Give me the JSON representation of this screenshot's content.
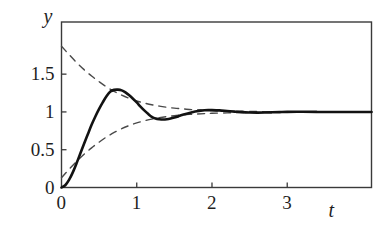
{
  "chart_data": {
    "type": "line",
    "title": "",
    "xlabel": "t",
    "ylabel": "y",
    "xlim": [
      0,
      4.12
    ],
    "ylim": [
      0,
      2.19
    ],
    "grid": false,
    "legend": null,
    "xticks": [
      0,
      1,
      2,
      3
    ],
    "xtick_labels": [
      "0",
      "1",
      "2",
      "3"
    ],
    "yticks": [
      0,
      0.5,
      1,
      1.5
    ],
    "ytick_labels": [
      "0",
      "0.5",
      "1",
      "1.5"
    ],
    "series": [
      {
        "name": "step response",
        "style": "solid",
        "color": "#121212",
        "linewidth": 2.6,
        "points": [
          [
            0.0,
            0.0
          ],
          [
            0.05,
            0.03
          ],
          [
            0.1,
            0.1
          ],
          [
            0.15,
            0.2
          ],
          [
            0.2,
            0.32
          ],
          [
            0.25,
            0.45
          ],
          [
            0.3,
            0.58
          ],
          [
            0.35,
            0.705
          ],
          [
            0.4,
            0.83
          ],
          [
            0.45,
            0.94
          ],
          [
            0.5,
            1.04
          ],
          [
            0.55,
            1.13
          ],
          [
            0.6,
            1.21
          ],
          [
            0.65,
            1.27
          ],
          [
            0.7,
            1.292
          ],
          [
            0.75,
            1.295
          ],
          [
            0.8,
            1.285
          ],
          [
            0.85,
            1.258
          ],
          [
            0.9,
            1.22
          ],
          [
            0.95,
            1.175
          ],
          [
            1.0,
            1.125
          ],
          [
            1.05,
            1.07
          ],
          [
            1.1,
            1.02
          ],
          [
            1.15,
            0.975
          ],
          [
            1.2,
            0.935
          ],
          [
            1.25,
            0.912
          ],
          [
            1.3,
            0.903
          ],
          [
            1.35,
            0.9
          ],
          [
            1.4,
            0.903
          ],
          [
            1.45,
            0.912
          ],
          [
            1.5,
            0.925
          ],
          [
            1.55,
            0.941
          ],
          [
            1.6,
            0.958
          ],
          [
            1.65,
            0.973
          ],
          [
            1.7,
            0.987
          ],
          [
            1.75,
            0.999
          ],
          [
            1.8,
            1.009
          ],
          [
            1.85,
            1.017
          ],
          [
            1.9,
            1.022
          ],
          [
            1.95,
            1.024
          ],
          [
            2.0,
            1.024
          ],
          [
            2.1,
            1.02
          ],
          [
            2.2,
            1.012
          ],
          [
            2.3,
            1.004
          ],
          [
            2.4,
            0.997
          ],
          [
            2.5,
            0.993
          ],
          [
            2.6,
            0.991
          ],
          [
            2.7,
            0.992
          ],
          [
            2.8,
            0.995
          ],
          [
            2.9,
            0.998
          ],
          [
            3.0,
            1.001
          ],
          [
            3.2,
            1.002
          ],
          [
            3.4,
            1.0
          ],
          [
            3.6,
            0.999
          ],
          [
            3.8,
            1.0
          ],
          [
            4.12,
            1.0
          ]
        ]
      },
      {
        "name": "upper envelope",
        "style": "dashed",
        "color": "#4a4a4a",
        "linewidth": 1.4,
        "points": [
          [
            0.0,
            1.87
          ],
          [
            0.1,
            1.76
          ],
          [
            0.2,
            1.655
          ],
          [
            0.3,
            1.56
          ],
          [
            0.4,
            1.475
          ],
          [
            0.5,
            1.4
          ],
          [
            0.6,
            1.33
          ],
          [
            0.7,
            1.272
          ],
          [
            0.8,
            1.222
          ],
          [
            0.9,
            1.18
          ],
          [
            1.0,
            1.145
          ],
          [
            1.1,
            1.118
          ],
          [
            1.2,
            1.095
          ],
          [
            1.3,
            1.077
          ],
          [
            1.4,
            1.062
          ],
          [
            1.5,
            1.05
          ],
          [
            1.6,
            1.041
          ],
          [
            1.7,
            1.033
          ],
          [
            1.8,
            1.027
          ],
          [
            1.9,
            1.022
          ],
          [
            2.0,
            1.018
          ],
          [
            2.2,
            1.012
          ],
          [
            2.4,
            1.008
          ],
          [
            2.6,
            1.005
          ],
          [
            2.8,
            1.003
          ],
          [
            3.0,
            1.002
          ],
          [
            3.4,
            1.001
          ],
          [
            4.12,
            1.0
          ]
        ]
      },
      {
        "name": "lower envelope",
        "style": "dashed",
        "color": "#4a4a4a",
        "linewidth": 1.4,
        "points": [
          [
            0.0,
            0.13
          ],
          [
            0.1,
            0.24
          ],
          [
            0.2,
            0.345
          ],
          [
            0.3,
            0.44
          ],
          [
            0.4,
            0.525
          ],
          [
            0.5,
            0.6
          ],
          [
            0.6,
            0.67
          ],
          [
            0.7,
            0.728
          ],
          [
            0.8,
            0.778
          ],
          [
            0.9,
            0.82
          ],
          [
            1.0,
            0.855
          ],
          [
            1.1,
            0.882
          ],
          [
            1.2,
            0.905
          ],
          [
            1.3,
            0.923
          ],
          [
            1.4,
            0.938
          ],
          [
            1.5,
            0.95
          ],
          [
            1.6,
            0.959
          ],
          [
            1.7,
            0.967
          ],
          [
            1.8,
            0.973
          ],
          [
            1.9,
            0.978
          ],
          [
            2.0,
            0.982
          ],
          [
            2.2,
            0.988
          ],
          [
            2.4,
            0.992
          ],
          [
            2.6,
            0.995
          ],
          [
            2.8,
            0.997
          ],
          [
            3.0,
            0.998
          ],
          [
            3.4,
            0.999
          ],
          [
            4.12,
            1.0
          ]
        ]
      }
    ]
  },
  "axis": {
    "y_label": "y",
    "x_label": "t"
  },
  "ticks": {
    "y": [
      {
        "label": "1.5",
        "value": 1.5
      },
      {
        "label": "1",
        "value": 1
      },
      {
        "label": "0.5",
        "value": 0.5
      },
      {
        "label": "0",
        "value": 0
      }
    ],
    "x": [
      {
        "label": "0",
        "value": 0
      },
      {
        "label": "1",
        "value": 1
      },
      {
        "label": "2",
        "value": 2
      },
      {
        "label": "3",
        "value": 3
      }
    ]
  }
}
